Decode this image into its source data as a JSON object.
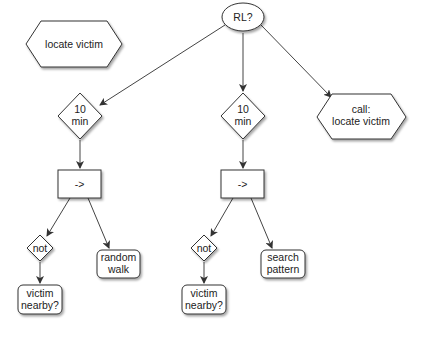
{
  "diagram": {
    "type": "behavior-tree",
    "nodes": {
      "locate_victim": {
        "shape": "hexagon",
        "lines": [
          "locate victim"
        ]
      },
      "rl": {
        "shape": "ellipse",
        "lines": [
          "RL?"
        ]
      },
      "timer_left": {
        "shape": "diamond",
        "lines": [
          "10",
          "min"
        ]
      },
      "timer_mid": {
        "shape": "diamond",
        "lines": [
          "10",
          "min"
        ]
      },
      "call_locate": {
        "shape": "hexagon",
        "lines": [
          "call:",
          "locate victim"
        ]
      },
      "seq_left": {
        "shape": "rect",
        "lines": [
          "->"
        ]
      },
      "seq_mid": {
        "shape": "rect",
        "lines": [
          "->"
        ]
      },
      "not_left": {
        "shape": "diamond",
        "lines": [
          "not"
        ]
      },
      "not_mid": {
        "shape": "diamond",
        "lines": [
          "not"
        ]
      },
      "random_walk": {
        "shape": "rounded-rect",
        "lines": [
          "random",
          "walk"
        ]
      },
      "search_pattern": {
        "shape": "rounded-rect",
        "lines": [
          "search",
          "pattern"
        ]
      },
      "victim_left": {
        "shape": "rounded-rect",
        "lines": [
          "victim",
          "nearby?"
        ]
      },
      "victim_mid": {
        "shape": "rounded-rect",
        "lines": [
          "victim",
          "nearby?"
        ]
      }
    },
    "edges": [
      {
        "from": "rl",
        "to": "timer_left"
      },
      {
        "from": "rl",
        "to": "timer_mid"
      },
      {
        "from": "rl",
        "to": "call_locate"
      },
      {
        "from": "timer_left",
        "to": "seq_left"
      },
      {
        "from": "timer_mid",
        "to": "seq_mid"
      },
      {
        "from": "seq_left",
        "to": "not_left"
      },
      {
        "from": "seq_left",
        "to": "random_walk"
      },
      {
        "from": "seq_mid",
        "to": "not_mid"
      },
      {
        "from": "seq_mid",
        "to": "search_pattern"
      },
      {
        "from": "not_left",
        "to": "victim_left"
      },
      {
        "from": "not_mid",
        "to": "victim_mid"
      }
    ]
  }
}
